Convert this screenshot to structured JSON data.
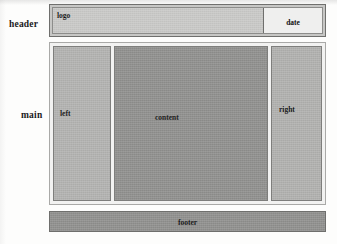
{
  "diagram": {
    "row_labels": [
      {
        "id": "header",
        "text": "header"
      },
      {
        "id": "main",
        "text": "main"
      }
    ],
    "header": {
      "logo_label": "logo",
      "date_label": "date"
    },
    "main": {
      "columns": [
        {
          "id": "left",
          "label": "left"
        },
        {
          "id": "content",
          "label": "content"
        },
        {
          "id": "right",
          "label": "right"
        }
      ]
    },
    "footer": {
      "label": "footer"
    },
    "colors": {
      "page_background": "#fdfdfc",
      "header_fill": "#c9c9c7",
      "date_fill": "#efefee",
      "left_fill": "#b2b2b0",
      "content_fill": "#8f8f8d",
      "right_fill": "#b0b0ae",
      "footer_fill": "#8f8f8d",
      "border_dark": "#6f6f6d",
      "border_light": "#a9a9a7",
      "text": "#111111"
    }
  }
}
